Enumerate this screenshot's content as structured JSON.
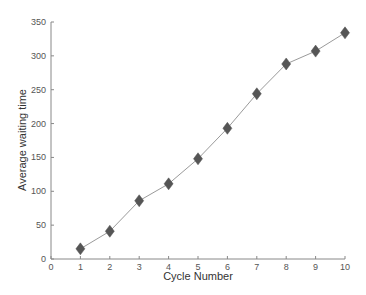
{
  "chart_data": {
    "type": "line",
    "title": "",
    "xlabel": "Cycle Number",
    "ylabel": "Average waiting time",
    "x": [
      1,
      2,
      3,
      4,
      5,
      6,
      7,
      8,
      9,
      10
    ],
    "series": [
      {
        "name": "Average waiting time",
        "values": [
          15,
          41,
          86,
          111,
          148,
          193,
          244,
          288,
          307,
          334
        ],
        "marker": "diamond",
        "marker_color": "#555555",
        "line_color": "#9a9a9a"
      }
    ],
    "xlim": [
      0,
      10
    ],
    "ylim": [
      0,
      350
    ],
    "xticks": [
      0,
      1,
      2,
      3,
      4,
      5,
      6,
      7,
      8,
      9,
      10
    ],
    "yticks": [
      0,
      50,
      100,
      150,
      200,
      250,
      300,
      350
    ],
    "grid": false,
    "legend": null
  }
}
